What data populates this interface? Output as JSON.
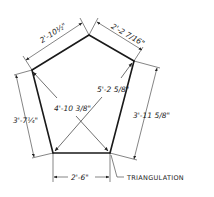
{
  "diagram": {
    "vertices": {
      "top": [
        89,
        35
      ],
      "right": [
        134,
        61
      ],
      "bottom_right": [
        110,
        153
      ],
      "bottom_left": [
        53,
        153
      ],
      "left": [
        32,
        70
      ]
    },
    "sides": {
      "top_left": "2'-10½\"",
      "top_right": "2'-2 7/16\"",
      "left": "3'-7¼\"",
      "right": "3'-11 5/8\"",
      "bottom": "2'-6\""
    },
    "diagonals": {
      "left_to_bottom_right": "4'-10 3/8\"",
      "right_to_bottom_left": "5'-2 5/8\""
    },
    "annotation": "TRIANGULATION",
    "colors": {
      "ink": "#1a1a1a",
      "paper": "#ffffff"
    }
  }
}
